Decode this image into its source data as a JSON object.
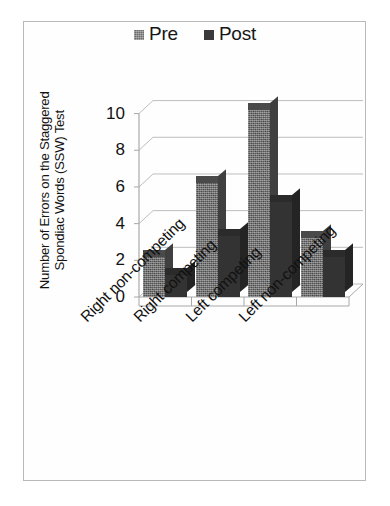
{
  "chart_data": {
    "type": "bar",
    "title": "",
    "xlabel": "",
    "ylabel": "Number of Errors on the Staggered Spondiac Words (SSW) Test",
    "ylabel_lines": [
      "Number of Errors on the Staggered",
      "Spondiac Words (SSW) Test"
    ],
    "categories": [
      "Right non-competing",
      "Right competing",
      "Left competing",
      "Left non-competing"
    ],
    "series": [
      {
        "name": "Pre",
        "values": [
          2.2,
          6.2,
          10.2,
          3.2
        ],
        "color": "#565656"
      },
      {
        "name": "Post",
        "values": [
          1.2,
          3.3,
          5.2,
          2.2
        ],
        "color": "#333333"
      }
    ],
    "ylim": [
      0,
      10
    ],
    "ytick_values": [
      0,
      2,
      4,
      6,
      8,
      10
    ],
    "ytick_labels": [
      "0",
      "2",
      "4",
      "6",
      "8",
      "10"
    ],
    "grid": true,
    "grid_axis": "y",
    "legend_position": "top-center",
    "style_3d": true
  },
  "legend": {
    "entries": [
      {
        "label": "Pre",
        "swatch": "pre-legend-swatch"
      },
      {
        "label": "Post",
        "swatch": "post-legend-swatch"
      }
    ]
  },
  "colors": {
    "pre": "#565656",
    "post": "#333333",
    "grid": "#bdbdbd",
    "axis": "#a8a8a8",
    "frame": "#b9b9b9",
    "text": "#121212",
    "background": "#ffffff"
  }
}
